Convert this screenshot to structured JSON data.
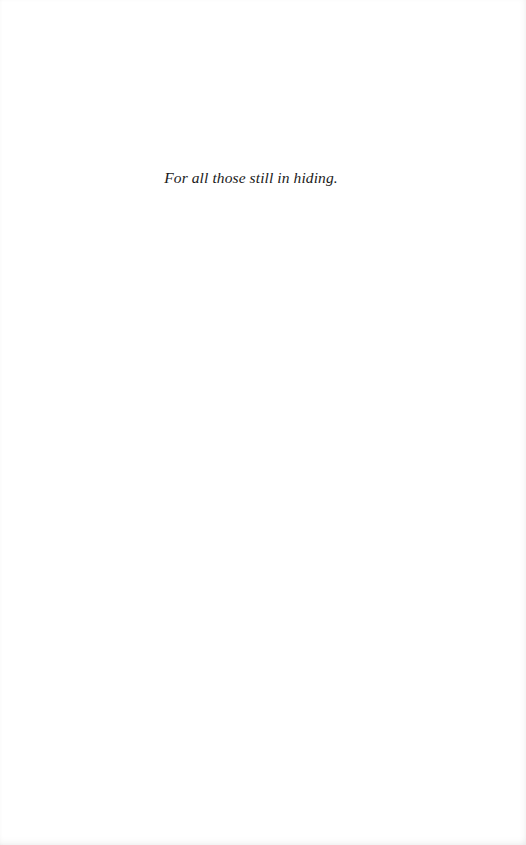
{
  "page": {
    "dedication": "For all those still in hiding."
  }
}
